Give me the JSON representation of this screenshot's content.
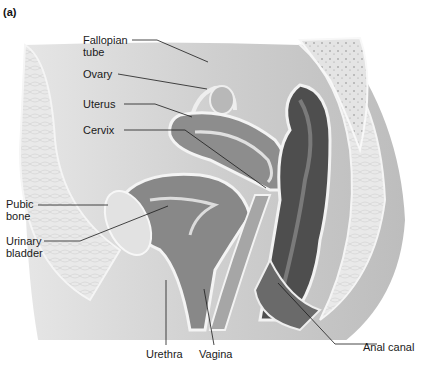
{
  "figure": {
    "panel_label": "(a)",
    "style": {
      "ink": "#1a1a1a",
      "tissue_dark": "#5a5a5a",
      "tissue_mid": "#9a9a9a",
      "tissue_light": "#d6d6d6",
      "background_tone": "#c8c8c8"
    }
  },
  "labels": {
    "fallopian_tube": "Fallopian\ntube",
    "ovary": "Ovary",
    "uterus": "Uterus",
    "cervix": "Cervix",
    "pubic_bone": "Pubic\nbone",
    "urinary_bladder": "Urinary\nbladder",
    "urethra": "Urethra",
    "vagina": "Vagina",
    "anal_canal": "Anal canal"
  }
}
